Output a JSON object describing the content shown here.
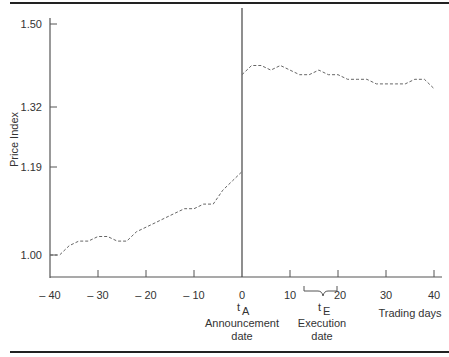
{
  "chart_data": {
    "type": "line",
    "title": "",
    "xlabel": "Trading days",
    "ylabel": "Price Index",
    "xlim": [
      -40,
      40
    ],
    "ylim": [
      0.94,
      1.52
    ],
    "grid": false,
    "legend": null,
    "x_ticks": [
      -40,
      -30,
      -20,
      -10,
      0,
      10,
      20,
      30,
      40
    ],
    "x_tick_labels": [
      "– 40",
      "– 30",
      "– 20",
      "– 10",
      "0",
      "10",
      "20",
      "30",
      "40"
    ],
    "y_ticks": [
      1.0,
      1.19,
      1.32,
      1.5
    ],
    "y_tick_labels": [
      "1.00",
      "1.19",
      "1.32",
      "1.50"
    ],
    "annotations": [
      {
        "x": 0,
        "label": "t",
        "subscript": "A",
        "text": "Announcement date",
        "note": "vertical line at announcement"
      },
      {
        "x_range": [
          12,
          20
        ],
        "label": "t",
        "subscript": "E",
        "text": "Execution date",
        "note": "brace marking execution window"
      }
    ],
    "series": [
      {
        "name": "Price Index",
        "style": "dashed",
        "x": [
          -40,
          -38,
          -36,
          -34,
          -32,
          -30,
          -28,
          -26,
          -24,
          -22,
          -20,
          -18,
          -16,
          -14,
          -12,
          -10,
          -8,
          -6,
          -4,
          -2,
          0,
          0,
          2,
          4,
          6,
          8,
          10,
          12,
          14,
          16,
          18,
          20,
          22,
          24,
          26,
          28,
          30,
          32,
          34,
          36,
          38,
          40
        ],
        "values": [
          1.0,
          1.0,
          1.02,
          1.03,
          1.03,
          1.04,
          1.04,
          1.03,
          1.03,
          1.05,
          1.06,
          1.07,
          1.08,
          1.09,
          1.1,
          1.1,
          1.11,
          1.11,
          1.14,
          1.16,
          1.18,
          1.39,
          1.41,
          1.41,
          1.4,
          1.41,
          1.4,
          1.39,
          1.39,
          1.4,
          1.39,
          1.39,
          1.38,
          1.38,
          1.38,
          1.37,
          1.37,
          1.37,
          1.37,
          1.38,
          1.38,
          1.36
        ]
      }
    ]
  },
  "axis": {
    "ylabel": "Price Index",
    "xlabel": "Trading days",
    "y_ticks": [
      {
        "label": "1.50",
        "y": 24
      },
      {
        "label": "1.32",
        "y": 107
      },
      {
        "label": "1.19",
        "y": 167
      },
      {
        "label": "1.00",
        "y": 255
      }
    ],
    "x_ticks": [
      {
        "label": "– 40",
        "x": 50
      },
      {
        "label": "– 30",
        "x": 98
      },
      {
        "label": "– 20",
        "x": 146
      },
      {
        "label": "– 10",
        "x": 194
      },
      {
        "label": "0",
        "x": 242
      },
      {
        "label": "10",
        "x": 290
      },
      {
        "label": "20",
        "x": 338
      },
      {
        "label": "30",
        "x": 386
      },
      {
        "label": "40",
        "x": 434
      }
    ]
  },
  "annotations": {
    "announce_t": "t",
    "announce_sub": "A",
    "announce_line1": "Announcement",
    "announce_line2": "date",
    "exec_t": "t",
    "exec_sub": "E",
    "exec_line1": "Execution",
    "exec_line2": "date"
  }
}
